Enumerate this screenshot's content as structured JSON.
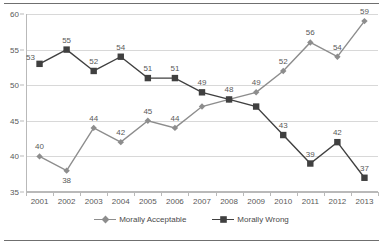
{
  "chart_data": {
    "type": "line",
    "title": "",
    "xlabel": "",
    "ylabel": "",
    "categories": [
      "2001",
      "2002",
      "2003",
      "2004",
      "2005",
      "2006",
      "2007",
      "2008",
      "2009",
      "2010",
      "2011",
      "2012",
      "2013"
    ],
    "ylim": [
      35,
      60
    ],
    "y_ticks": [
      35,
      40,
      45,
      50,
      55,
      60
    ],
    "grid": true,
    "legend_position": "bottom",
    "series": [
      {
        "name": "Morally Acceptable",
        "color": "#8d8d8d",
        "marker": "diamond",
        "values": [
          40,
          38,
          44,
          42,
          45,
          44,
          47,
          48,
          49,
          52,
          56,
          54,
          59
        ],
        "labels": [
          "40",
          "38",
          "44",
          "42",
          "45",
          "44",
          "47",
          "48",
          "49",
          "52",
          "56",
          "54",
          "59"
        ],
        "label_positions": [
          "above",
          "below",
          "above",
          "above",
          "above",
          "above",
          "hidden",
          "hidden",
          "above",
          "above",
          "above",
          "above",
          "above"
        ]
      },
      {
        "name": "Morally Wrong",
        "color": "#404040",
        "marker": "square",
        "values": [
          53,
          55,
          52,
          54,
          51,
          51,
          49,
          48,
          47,
          43,
          39,
          42,
          37
        ],
        "labels": [
          "53",
          "55",
          "52",
          "54",
          "51",
          "51",
          "49",
          "48",
          "47",
          "43",
          "39",
          "42",
          "37"
        ],
        "label_positions": [
          "left",
          "above",
          "above",
          "above",
          "above",
          "above",
          "above",
          "above",
          "hidden",
          "above",
          "above",
          "above",
          "above"
        ]
      }
    ]
  },
  "legend": {
    "entries": [
      {
        "label": "Morally Acceptable"
      },
      {
        "label": "Morally Wrong"
      }
    ]
  }
}
